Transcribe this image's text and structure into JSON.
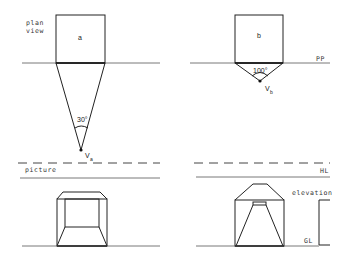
{
  "diagram": {
    "left": {
      "plan_label_line1": "plan",
      "plan_label_line2": "view",
      "square_label": "a",
      "angle_label": "30°",
      "vanishing_point": "V",
      "vanishing_subscript": "a",
      "picture_label": "picture"
    },
    "right": {
      "square_label": "b",
      "angle_label": "100°",
      "vanishing_point": "V",
      "vanishing_subscript": "b",
      "pp_label": "PP",
      "hl_label": "HL",
      "elevation_label": "elevation",
      "gl_label": "GL"
    },
    "colors": {
      "line": "#222222",
      "background": "#ffffff"
    }
  }
}
